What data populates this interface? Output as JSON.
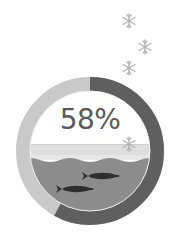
{
  "gauge": {
    "value_label": "58%",
    "percent": 58,
    "colors": {
      "filled": "#5f5f5f",
      "remaining": "#c9c9c9",
      "ice": "#dcdcdc",
      "water": "#8c8c8c",
      "fish": "#2e2e2e",
      "snowflake": "#b5b5b5",
      "text": "#5a5a5a"
    }
  },
  "decorations": {
    "snowflakes": 4,
    "fish": 2,
    "icons": [
      "snowflake-icon",
      "fish-icon"
    ]
  }
}
